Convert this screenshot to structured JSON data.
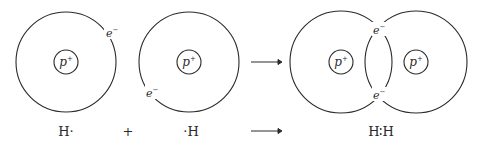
{
  "diagram": {
    "atom1": {
      "nucleus": "p",
      "nucleus_sup": "+",
      "electron": "e",
      "electron_sup": "−"
    },
    "atom2": {
      "nucleus": "p",
      "nucleus_sup": "+",
      "electron": "e",
      "electron_sup": "−"
    },
    "molecule": {
      "nucleus_left": "p",
      "nucleus_right": "p",
      "nucleus_sup": "+",
      "electron_top": "e",
      "electron_bottom": "e",
      "electron_sup": "−"
    },
    "equation": {
      "reactant1": "H·",
      "plus": "+",
      "reactant2": "·H",
      "product": "H∶H"
    }
  }
}
